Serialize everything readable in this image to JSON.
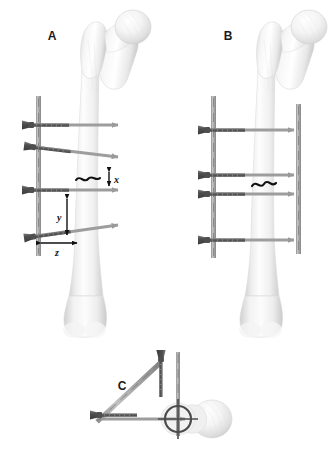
{
  "figure": {
    "background_color": "#ffffff",
    "width": 328,
    "height": 460
  },
  "panels": [
    {
      "id": "A",
      "label": "A",
      "label_x": 52,
      "label_y": 40,
      "description": "Anterior femur with unilateral external fixator, oblique half-pins and fracture gap annotations",
      "fracture_marker": "wavy-line",
      "annotations": [
        {
          "name": "x",
          "label": "x",
          "type": "vertical-double-arrow",
          "label_x": 117,
          "label_y": 184
        },
        {
          "name": "y",
          "label": "y",
          "type": "vertical-double-arrow",
          "label_x": 60,
          "label_y": 218
        },
        {
          "name": "z",
          "label": "z",
          "type": "horizontal-double-arrow",
          "label_x": 56,
          "label_y": 252
        }
      ]
    },
    {
      "id": "B",
      "label": "B",
      "label_x": 228,
      "label_y": 40,
      "description": "Anterior femur with bilateral external fixator frame, four transverse pins between two vertical rods",
      "fracture_marker": "wavy-line",
      "annotations": []
    },
    {
      "id": "C",
      "label": "C",
      "label_x": 122,
      "label_y": 390,
      "description": "Axial view of proximal femur showing pin orientation and crosshair target on femoral shaft",
      "fracture_marker": "none",
      "annotations": []
    }
  ],
  "hardware": {
    "screw_label": "bone-screw",
    "rod_label": "fixator-rod",
    "arrow_label": "pin-trajectory-arrow",
    "crosshair_label": "axial-crosshair"
  },
  "colors": {
    "bone_light": "#fbfbfb",
    "bone_mid": "#e4e4e4",
    "bone_shadow": "#c9c9c9",
    "bone_outline": "#d6d6d6",
    "screw_dark": "#4a4a4a",
    "screw_mid": "#6f6f6f",
    "rod_gray": "#a8a8a8",
    "arrow_gray": "#9a9a9a",
    "fracture_black": "#111111",
    "label_black": "#1a1a1a"
  }
}
